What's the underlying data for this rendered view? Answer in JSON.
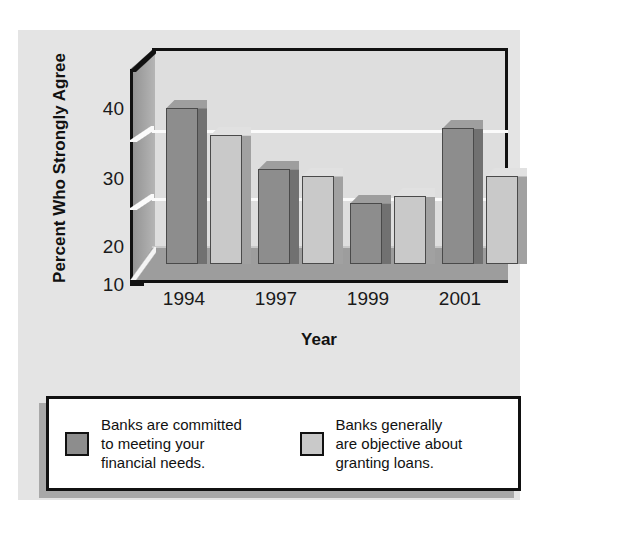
{
  "chart_data": {
    "type": "bar",
    "title": "",
    "xlabel": "Year",
    "ylabel": "Percent Who Strongly Agree",
    "categories": [
      "1994",
      "1997",
      "1999",
      "2001"
    ],
    "series": [
      {
        "name": "Banks are committed to meeting your financial needs.",
        "color": "#8d8d8d",
        "values": [
          33,
          24,
          19,
          30
        ]
      },
      {
        "name": "Banks generally are objective about granting loans.",
        "color": "#c9c9c9",
        "values": [
          29,
          23,
          20,
          23
        ]
      }
    ],
    "yticks": [
      10,
      20,
      30,
      40
    ],
    "ylim": [
      10,
      42
    ],
    "gridlines": [
      20,
      30
    ],
    "grid": true,
    "legend_position": "bottom",
    "style": "3d-column"
  },
  "axes": {
    "y_title": "Percent Who Strongly Agree",
    "x_title": "Year",
    "y_tick_labels": [
      "40",
      "30",
      "20",
      "10"
    ],
    "x_tick_labels": [
      "1994",
      "1997",
      "1999",
      "2001"
    ]
  },
  "legend": {
    "items": [
      {
        "label": "Banks are committed\nto meeting your\nfinancial needs.",
        "swatch_color": "#8d8d8d"
      },
      {
        "label": "Banks generally\nare objective about\ngranting loans.",
        "swatch_color": "#c9c9c9"
      }
    ]
  },
  "colors": {
    "panel_background": "#e4e4e4",
    "plot_background": "#dedede",
    "series_1": "#8d8d8d",
    "series_2": "#c9c9c9",
    "gridline": "#fbfbfb",
    "frame": "#111111"
  }
}
